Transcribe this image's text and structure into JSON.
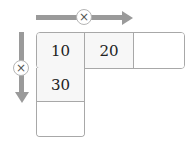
{
  "diagram": {
    "type": "multiplication-table",
    "horizontal_operator": {
      "symbol": "×",
      "icon": "multiply-icon",
      "arrow": "right-arrow"
    },
    "vertical_operator": {
      "symbol": "×",
      "icon": "multiply-icon",
      "arrow": "down-arrow"
    },
    "cells": {
      "r0c0": "10",
      "r0c1": "20",
      "r0c2": "",
      "r1c0": "30",
      "r2c0": ""
    },
    "colors": {
      "arrow": "#9a9a9a",
      "border": "#a8a8a8",
      "filled_cell_bg": "#f7f7f7",
      "empty_cell_bg": "#ffffff"
    }
  }
}
